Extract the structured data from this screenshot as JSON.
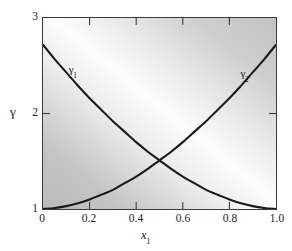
{
  "figure": {
    "background_color": "#ffffff",
    "frame_color": "#3a3a3a",
    "curve_color": "#1a1a1a"
  },
  "axes": {
    "y": {
      "title": "γ",
      "ticks": [
        "1",
        "2",
        "3"
      ],
      "tick_values": [
        1,
        2,
        3
      ],
      "min": 1,
      "max": 3
    },
    "x": {
      "title_base": "x",
      "title_sub": "1",
      "ticks": [
        "0",
        "0.2",
        "0.4",
        "0.6",
        "0.8",
        "1.0"
      ],
      "tick_values": [
        0,
        0.2,
        0.4,
        0.6,
        0.8,
        1.0
      ],
      "min": 0,
      "max": 1
    }
  },
  "curve_labels": {
    "gamma1": {
      "base": "γ",
      "sub": "1"
    },
    "gamma2": {
      "base": "γ",
      "sub": "2"
    }
  },
  "chart_data": {
    "type": "line",
    "title": "",
    "xlabel": "x1",
    "ylabel": "γ",
    "xlim": [
      0,
      1
    ],
    "ylim": [
      1,
      3
    ],
    "grid": false,
    "legend": "inline curve labels",
    "xticks": [
      0,
      0.2,
      0.4,
      0.6,
      0.8,
      1.0
    ],
    "yticks": [
      1,
      2,
      3
    ],
    "x": [
      0.0,
      0.05,
      0.1,
      0.15,
      0.2,
      0.25,
      0.3,
      0.35,
      0.4,
      0.45,
      0.5,
      0.55,
      0.6,
      0.65,
      0.7,
      0.75,
      0.8,
      0.85,
      0.9,
      0.95,
      1.0
    ],
    "series": [
      {
        "name": "γ1",
        "label": "γ₁",
        "values": [
          2.72,
          2.57,
          2.43,
          2.29,
          2.16,
          2.04,
          1.92,
          1.81,
          1.7,
          1.6,
          1.51,
          1.42,
          1.34,
          1.27,
          1.2,
          1.15,
          1.1,
          1.06,
          1.03,
          1.01,
          1.0
        ]
      },
      {
        "name": "γ2",
        "label": "γ₂",
        "values": [
          1.0,
          1.01,
          1.03,
          1.06,
          1.1,
          1.15,
          1.2,
          1.27,
          1.34,
          1.42,
          1.51,
          1.6,
          1.7,
          1.81,
          1.92,
          2.04,
          2.16,
          2.29,
          2.43,
          2.57,
          2.72
        ]
      }
    ],
    "annotations": [
      {
        "text": "γ₁",
        "x": 0.11,
        "y": 2.46
      },
      {
        "text": "γ₂",
        "x": 0.84,
        "y": 2.42
      }
    ],
    "intersection": {
      "x": 0.5,
      "y": 1.51
    }
  }
}
